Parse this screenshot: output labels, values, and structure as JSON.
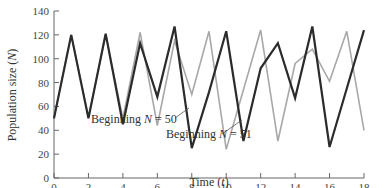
{
  "chart_data": {
    "type": "line",
    "title": "",
    "xlabel": "Time (t)",
    "xlabel_parts": {
      "prefix": "Time (",
      "var": "t",
      "suffix": ")"
    },
    "ylabel": "Population size (N)",
    "ylabel_parts": {
      "prefix": "Population size (",
      "var": "N",
      "suffix": ")"
    },
    "xlim": [
      0,
      18
    ],
    "ylim": [
      0,
      140
    ],
    "x_ticks": [
      0,
      2,
      4,
      6,
      8,
      10,
      12,
      14,
      16,
      18
    ],
    "y_ticks": [
      0,
      20,
      40,
      60,
      80,
      100,
      120,
      140
    ],
    "grid": false,
    "x": [
      0,
      1,
      2,
      3,
      4,
      5,
      6,
      7,
      8,
      9,
      10,
      11,
      12,
      13,
      14,
      15,
      16,
      17,
      18
    ],
    "series": [
      {
        "name": "Beginning N = 50",
        "color": "#2b2b2b",
        "values": [
          50,
          120,
          50,
          121,
          45,
          113,
          68,
          127,
          25,
          72,
          123,
          31,
          92,
          113,
          67,
          127,
          26,
          75,
          124
        ]
      },
      {
        "name": "Beginning N = 51",
        "color": "#a8a8a8",
        "values": [
          51,
          120,
          51,
          120,
          50,
          122,
          44,
          115,
          70,
          123,
          24,
          74,
          124,
          31,
          96,
          108,
          81,
          123,
          40
        ]
      }
    ],
    "annotations": [
      {
        "text_prefix": "Beginning ",
        "var": "N",
        "text_suffix": " = 50",
        "points_to_series": 0,
        "at_x": 8
      },
      {
        "text_prefix": "Beginning ",
        "var": "N",
        "text_suffix": " = 51",
        "points_to_series": 1,
        "at_x": 10
      }
    ],
    "legend": "none (inline annotations)"
  }
}
